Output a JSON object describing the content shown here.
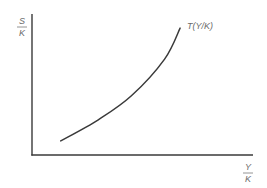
{
  "chart_data": {
    "type": "line",
    "title": "",
    "ylabel": {
      "numerator": "S",
      "denominator": "K"
    },
    "xlabel": {
      "numerator": "Y",
      "denominator": "K"
    },
    "grid": false,
    "xlim": [
      0,
      1
    ],
    "ylim": [
      0,
      1
    ],
    "series": [
      {
        "name": "T(Y/K)",
        "label": "T(Y/K)",
        "shape": "increasing convex",
        "x": [
          0.13,
          0.3,
          0.45,
          0.6,
          0.67
        ],
        "y": [
          0.1,
          0.25,
          0.42,
          0.68,
          0.9
        ]
      }
    ]
  }
}
